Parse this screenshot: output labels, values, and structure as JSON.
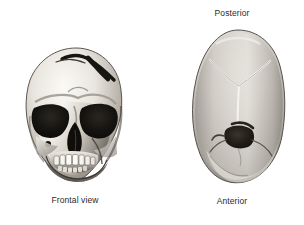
{
  "figure": {
    "background_color": "#ffffff",
    "type": "anatomical-photo-plate",
    "panels": [
      {
        "id": "frontal",
        "caption": "Frontal view",
        "subject": "human skull, anterior (frontal) view",
        "features": [
          "frontal-bone-fracture",
          "orbits",
          "nasal-aperture",
          "maxillary-teeth",
          "mandible"
        ]
      },
      {
        "id": "vertex",
        "caption_top": "Posterior",
        "caption_bottom": "Anterior",
        "subject": "human skull, superior (vertex) view",
        "features": [
          "sagittal-suture",
          "lambdoid-suture",
          "cranial-defect"
        ]
      }
    ]
  },
  "labels": {
    "frontal_view": "Frontal view",
    "posterior": "Posterior",
    "anterior": "Anterior"
  },
  "colors": {
    "background": "#ffffff",
    "text": "#2b2b2b",
    "bone_light": "#f2efe9",
    "bone_mid": "#b9b4ad",
    "bone_shadow": "#6e6a65",
    "bone_dark": "#3c3a37",
    "cavity_black": "#15130f",
    "vertex_light": "#e7e4de",
    "vertex_mid": "#b6b2ab",
    "vertex_dark": "#7c7872"
  },
  "icons": {
    "frontal_skull": "skull-frontal-icon",
    "vertex_skull": "skull-vertex-icon"
  }
}
